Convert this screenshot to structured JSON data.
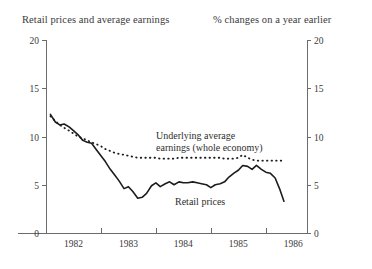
{
  "header": {
    "left_title": "Retail prices and average earnings",
    "right_title": "% changes on a year earlier"
  },
  "annotations": {
    "earnings_line1": "Underlying average",
    "earnings_line2": "earnings (whole economy)",
    "retail": "Retail prices"
  },
  "chart_data": {
    "type": "line",
    "title": "Retail prices and average earnings",
    "subtitle": "% changes on a year earlier",
    "xlabel": "",
    "ylabel": "",
    "ylim": [
      0,
      20
    ],
    "xlim": [
      1981.5,
      1986.25
    ],
    "grid": false,
    "legend": "inline-annotations",
    "y_ticks": [
      0,
      5,
      10,
      15,
      20
    ],
    "y_tick_labels": [
      "0",
      "5",
      "10",
      "15",
      "20"
    ],
    "right_axis_ticks": [
      0,
      5,
      10,
      15,
      20
    ],
    "right_axis_tick_labels": [
      "0",
      "5",
      "10",
      "15",
      "20"
    ],
    "x_tick_labels": [
      "1982",
      "1983",
      "1984",
      "1985",
      "1986"
    ],
    "x_tick_positions": [
      1982,
      1983,
      1984,
      1985,
      1986
    ],
    "series": [
      {
        "name": "Retail prices",
        "style": "solid",
        "color": "#1c1c1c",
        "x": [
          1981.58,
          1981.67,
          1981.75,
          1981.83,
          1981.92,
          1982.0,
          1982.08,
          1982.17,
          1982.25,
          1982.33,
          1982.42,
          1982.5,
          1982.58,
          1982.67,
          1982.75,
          1982.83,
          1982.92,
          1983.0,
          1983.08,
          1983.17,
          1983.25,
          1983.33,
          1983.42,
          1983.5,
          1983.58,
          1983.67,
          1983.75,
          1983.83,
          1983.92,
          1984.0,
          1984.08,
          1984.17,
          1984.25,
          1984.33,
          1984.42,
          1984.5,
          1984.58,
          1984.67,
          1984.75,
          1984.83,
          1984.92,
          1985.0,
          1985.08,
          1985.17,
          1985.25,
          1985.33,
          1985.42,
          1985.5,
          1985.58,
          1985.67,
          1985.75,
          1985.83
        ],
        "y": [
          12.3,
          11.5,
          11.2,
          11.3,
          11.0,
          10.6,
          10.2,
          9.6,
          9.4,
          9.3,
          8.6,
          8.0,
          7.4,
          6.6,
          6.0,
          5.4,
          4.6,
          4.8,
          4.3,
          3.6,
          3.7,
          4.1,
          4.9,
          5.2,
          4.8,
          5.1,
          5.3,
          5.0,
          5.3,
          5.2,
          5.2,
          5.3,
          5.2,
          5.1,
          5.0,
          4.7,
          5.0,
          5.1,
          5.3,
          5.8,
          6.2,
          6.5,
          7.0,
          6.9,
          6.6,
          7.0,
          6.6,
          6.3,
          6.2,
          5.7,
          4.6,
          3.3
        ]
      },
      {
        "name": "Underlying average earnings (whole economy)",
        "style": "dotted",
        "color": "#1c1c1c",
        "x": [
          1981.58,
          1981.67,
          1981.75,
          1981.83,
          1981.92,
          1982.0,
          1982.08,
          1982.17,
          1982.25,
          1982.33,
          1982.42,
          1982.5,
          1982.58,
          1982.67,
          1982.75,
          1982.83,
          1982.92,
          1983.0,
          1983.08,
          1983.17,
          1983.25,
          1983.33,
          1983.42,
          1983.5,
          1983.58,
          1983.67,
          1983.75,
          1983.83,
          1983.92,
          1984.0,
          1984.08,
          1984.17,
          1984.25,
          1984.33,
          1984.42,
          1984.5,
          1984.58,
          1984.67,
          1984.75,
          1984.83,
          1984.92,
          1985.0,
          1985.08,
          1985.17,
          1985.25,
          1985.33,
          1985.42,
          1985.5,
          1985.58,
          1985.67,
          1985.75,
          1985.83
        ],
        "y": [
          12.1,
          11.6,
          11.2,
          10.9,
          10.6,
          10.3,
          10.0,
          9.8,
          9.6,
          9.4,
          9.2,
          9.0,
          8.7,
          8.5,
          8.3,
          8.2,
          8.1,
          8.0,
          7.9,
          7.8,
          7.8,
          7.8,
          7.8,
          7.8,
          7.7,
          7.7,
          7.7,
          7.7,
          7.8,
          7.8,
          7.8,
          7.8,
          7.8,
          7.8,
          7.8,
          7.8,
          7.8,
          7.8,
          7.7,
          7.7,
          7.7,
          7.8,
          8.1,
          7.8,
          7.6,
          7.5,
          7.5,
          7.5,
          7.5,
          7.5,
          7.5,
          7.5
        ]
      }
    ]
  }
}
